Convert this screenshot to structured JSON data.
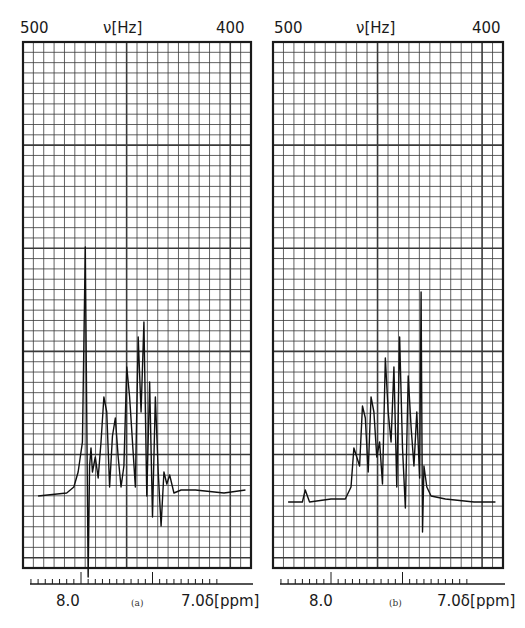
{
  "chart_data": [
    {
      "type": "line",
      "panel": "a",
      "caption": "(a)",
      "title": "",
      "top_axis": {
        "label": "ν[Hz]",
        "ticks": [
          "500",
          "400"
        ],
        "range": [
          500,
          400
        ]
      },
      "bottom_axis": {
        "label": "δ[ppm]",
        "ticks": [
          "8.0",
          "7.0"
        ]
      },
      "grid": true,
      "description": "1H NMR aromatic region; sharp singlet near 7.95 ppm, multiplet cluster 7.4–7.85 ppm",
      "x_ppm": [
        8.3,
        8.1,
        8.05,
        8.02,
        7.99,
        7.97,
        7.96,
        7.95,
        7.94,
        7.93,
        7.92,
        7.9,
        7.88,
        7.86,
        7.84,
        7.82,
        7.8,
        7.78,
        7.76,
        7.74,
        7.72,
        7.7,
        7.68,
        7.66,
        7.64,
        7.62,
        7.6,
        7.58,
        7.56,
        7.54,
        7.52,
        7.5,
        7.48,
        7.46,
        7.44,
        7.42,
        7.4,
        7.38,
        7.35,
        7.3,
        7.2,
        7.0,
        6.85
      ],
      "y_rel": [
        0.02,
        0.03,
        0.05,
        0.1,
        0.2,
        0.85,
        0.3,
        -0.25,
        0.12,
        0.18,
        0.1,
        0.15,
        0.08,
        0.2,
        0.35,
        0.3,
        0.05,
        0.22,
        0.28,
        0.15,
        0.05,
        0.12,
        0.45,
        0.35,
        0.2,
        0.05,
        0.55,
        0.3,
        0.6,
        0.02,
        0.4,
        -0.05,
        0.35,
        0.1,
        -0.08,
        0.1,
        0.06,
        0.09,
        0.03,
        0.04,
        0.04,
        0.03,
        0.04
      ]
    },
    {
      "type": "line",
      "panel": "b",
      "caption": "(b)",
      "title": "",
      "top_axis": {
        "label": "ν[Hz]",
        "ticks": [
          "500",
          "400"
        ],
        "range": [
          500,
          400
        ]
      },
      "bottom_axis": {
        "label": "δ[ppm]",
        "ticks": [
          "8.0",
          "7.0"
        ]
      },
      "grid": true,
      "description": "1H NMR aromatic region; multiplet 7.6–7.35 ppm with tallest line near 7.37 ppm",
      "x_ppm": [
        8.3,
        8.2,
        8.18,
        8.15,
        8.0,
        7.9,
        7.86,
        7.84,
        7.82,
        7.8,
        7.78,
        7.76,
        7.74,
        7.72,
        7.7,
        7.68,
        7.66,
        7.64,
        7.62,
        7.6,
        7.58,
        7.56,
        7.54,
        7.52,
        7.5,
        7.48,
        7.46,
        7.44,
        7.42,
        7.4,
        7.38,
        7.37,
        7.36,
        7.35,
        7.33,
        7.3,
        7.2,
        7.0,
        6.85
      ],
      "y_rel": [
        0.0,
        0.0,
        0.04,
        0.0,
        0.01,
        0.01,
        0.05,
        0.18,
        0.15,
        0.12,
        0.32,
        0.28,
        0.1,
        0.35,
        0.3,
        0.15,
        0.2,
        0.06,
        0.48,
        0.3,
        0.2,
        0.45,
        0.05,
        0.55,
        0.18,
        -0.02,
        0.42,
        0.25,
        0.12,
        0.3,
        0.08,
        0.7,
        -0.1,
        0.12,
        0.05,
        0.02,
        0.01,
        0.0,
        0.0
      ]
    }
  ],
  "panels": {
    "a": {
      "hz_left": "500",
      "hz_mid": "ν[Hz]",
      "hz_right": "400",
      "ppm_left": "8.0",
      "ppm_right": "7.0δ[ppm]",
      "caption": "(a)"
    },
    "b": {
      "hz_left": "500",
      "hz_mid": "ν[Hz]",
      "hz_right": "400",
      "ppm_left": "8.0",
      "ppm_right": "7.0δ[ppm]",
      "caption": "(b)"
    }
  },
  "colors": {
    "grid": "#3a3a3a",
    "trace": "#111111",
    "frame": "#1a1a1a"
  }
}
